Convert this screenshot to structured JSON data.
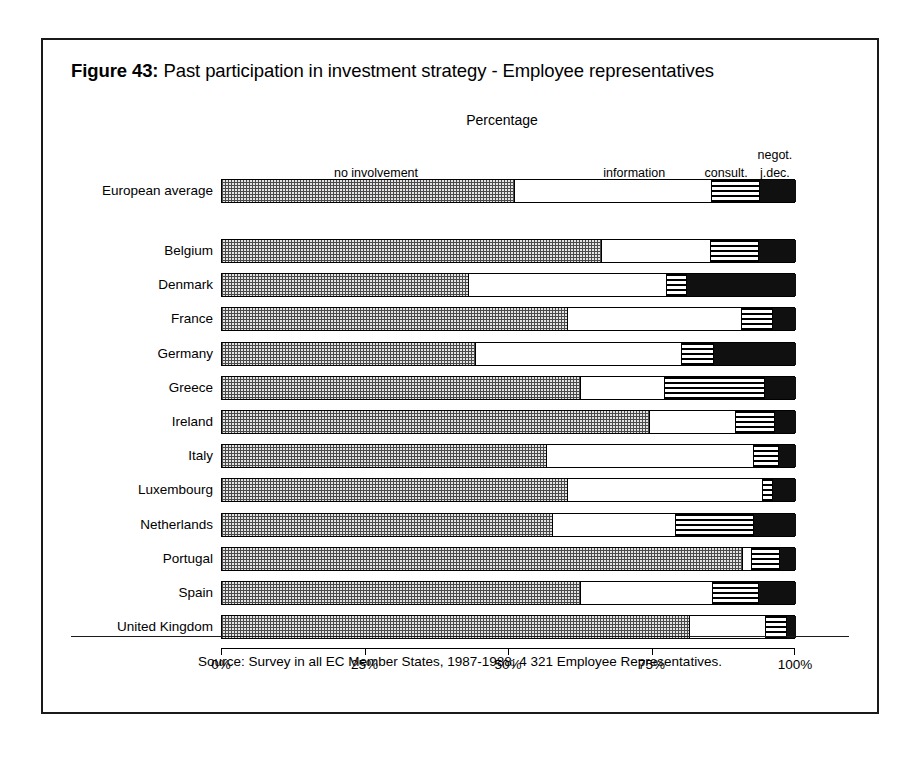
{
  "figure": {
    "number": "Figure 43:",
    "title": "Past participation in investment strategy - Employee representatives",
    "caption": "Percentage",
    "source": "Source: Survey in all EC Member States, 1987-1988; 4 321 Employee Representatives."
  },
  "chart_data": {
    "type": "bar",
    "orientation": "horizontal",
    "stacked": true,
    "title": "Past participation in investment strategy - Employee representatives",
    "subtitle": "Percentage",
    "xlabel": "Percentage",
    "ylabel": "",
    "xlim": [
      0,
      100
    ],
    "xticks": [
      0,
      25,
      50,
      75,
      100
    ],
    "xtick_labels": [
      "0%",
      "25%",
      "50%",
      "75%",
      "100%"
    ],
    "grid": false,
    "legend_position": "top",
    "series": [
      {
        "name": "no involvement",
        "key": "no_involvement",
        "pattern": "dotted",
        "values": [
          50.8,
          66.0,
          42.9,
          60.1,
          44.1,
          62.4,
          74.4,
          56.4,
          60.1,
          57.5,
          90.6,
          62.4,
          81.4
        ]
      },
      {
        "name": "information",
        "key": "information",
        "pattern": "white",
        "values": [
          34.4,
          19.0,
          34.5,
          30.3,
          35.9,
          14.6,
          15.0,
          36.1,
          33.9,
          21.4,
          1.6,
          23.0,
          13.2
        ]
      },
      {
        "name": "consult.",
        "key": "consultation",
        "pattern": "striped",
        "values": [
          8.4,
          8.4,
          3.4,
          5.5,
          5.6,
          17.4,
          6.8,
          4.4,
          1.8,
          13.6,
          4.8,
          8.0,
          3.7
        ]
      },
      {
        "name": "negot. j.dec.",
        "key": "negotiation_joint_decision",
        "pattern": "black",
        "values": [
          6.4,
          6.6,
          19.2,
          4.1,
          14.4,
          5.6,
          3.8,
          3.1,
          4.2,
          7.5,
          3.0,
          6.6,
          1.7
        ]
      }
    ],
    "categories": [
      "European average",
      "Belgium",
      "Denmark",
      "France",
      "Germany",
      "Greece",
      "Ireland",
      "Italy",
      "Luxembourg",
      "Netherlands",
      "Portugal",
      "Spain",
      "United Kingdom"
    ],
    "segment_labels": [
      {
        "text": "no involvement",
        "center_pct": 27
      },
      {
        "text": "information",
        "center_pct": 72
      },
      {
        "text": "consult.",
        "center_pct": 88
      },
      {
        "text": "negot.",
        "center_pct": 96.5
      },
      {
        "text": "j.dec.",
        "center_pct": 96.5
      }
    ]
  },
  "colors": {
    "frame": "#1a1a1a",
    "ink": "#000000",
    "dotted_fill": "#e3e3e3",
    "black_fill": "#101010",
    "background": "#ffffff"
  }
}
